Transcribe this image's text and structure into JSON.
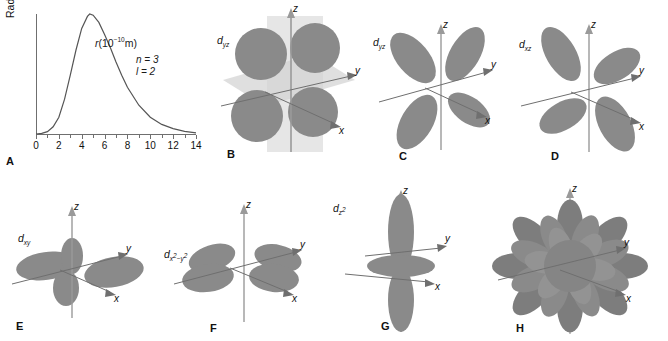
{
  "figure": {
    "type": "scientific-figure",
    "lobe_color": "#8a8a8a",
    "axis_color": "#6f6f6f",
    "plane_color": "#cfcfcf"
  },
  "chart_data": {
    "type": "line",
    "title": "",
    "xlabel": "r (10^-10 m)",
    "ylabel": "Radial probability distribution",
    "xlim": [
      0,
      14
    ],
    "ylim": [
      0,
      1
    ],
    "grid": false,
    "legend": "none",
    "xticks": [
      0,
      2,
      4,
      6,
      8,
      10,
      12,
      14
    ],
    "yticks": [],
    "annotations": [
      "n = 3",
      "l = 2"
    ],
    "x": [
      0,
      0.5,
      1,
      1.5,
      2,
      2.5,
      3,
      3.5,
      4,
      4.5,
      4.7,
      5,
      5.5,
      6,
      6.5,
      7,
      7.5,
      8,
      9,
      10,
      11,
      12,
      13,
      14
    ],
    "y": [
      0,
      0.005,
      0.02,
      0.06,
      0.14,
      0.29,
      0.49,
      0.7,
      0.88,
      0.98,
      1.0,
      0.99,
      0.93,
      0.83,
      0.72,
      0.6,
      0.49,
      0.39,
      0.24,
      0.14,
      0.08,
      0.045,
      0.022,
      0.01
    ]
  },
  "panels": {
    "A": {
      "letter": "A",
      "ylabel": "Radial probability distribution",
      "xlabel_r": "r",
      "xlabel_unit_open": "(10",
      "xlabel_exp": "−10",
      "xlabel_unit_close": "m)",
      "tick_labels": [
        "0",
        "2",
        "4",
        "6",
        "8",
        "10",
        "12",
        "14"
      ],
      "annot_n": "n = 3",
      "annot_l": "l = 2"
    },
    "B": {
      "letter": "B",
      "orbital_base": "d",
      "orbital_sub": "yz",
      "axes": [
        "z",
        "y",
        "x"
      ],
      "note": "d-orbital with nodal planes shown"
    },
    "C": {
      "letter": "C",
      "orbital_base": "d",
      "orbital_sub": "yz",
      "axes": [
        "z",
        "y",
        "x"
      ]
    },
    "D": {
      "letter": "D",
      "orbital_base": "d",
      "orbital_sub": "xz",
      "axes": [
        "z",
        "y",
        "x"
      ]
    },
    "E": {
      "letter": "E",
      "orbital_base": "d",
      "orbital_sub": "xy",
      "axes": [
        "z",
        "y",
        "x"
      ]
    },
    "F": {
      "letter": "F",
      "orbital_base": "d",
      "orbital_sub_x": "x",
      "orbital_sub_x_exp": "2",
      "orbital_sub_minus": "−",
      "orbital_sub_y": "y",
      "orbital_sub_y_exp": "2",
      "axes": [
        "z",
        "y",
        "x"
      ]
    },
    "G": {
      "letter": "G",
      "orbital_base": "d",
      "orbital_sub_z": "z",
      "orbital_sub_z_exp": "2",
      "axes": [
        "z",
        "y",
        "x"
      ]
    },
    "H": {
      "letter": "H",
      "axes": [
        "z",
        "y",
        "x"
      ],
      "note": "superposition of all five d orbitals"
    }
  }
}
